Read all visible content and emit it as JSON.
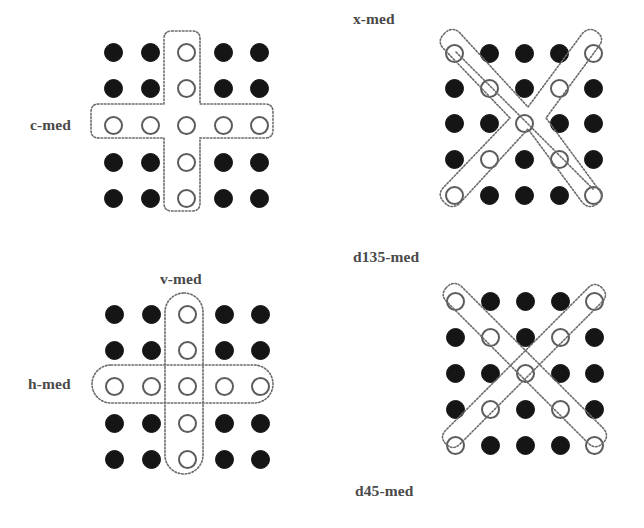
{
  "figure": {
    "background_color": "#ffffff",
    "dot_filled_color": "#151515",
    "dot_hollow_fill": "#ffffff",
    "dot_hollow_stroke": "#5c5c5c",
    "outline_color": "#6b6b6b",
    "label_color": "#4a4a4a",
    "grid_rows": 5,
    "grid_cols": 5
  },
  "panels": [
    {
      "id": "c-med",
      "label": "c-med",
      "label_position": "left",
      "description": "Cross / plus shaped median neighbourhood: full centre row and full centre column selected.",
      "selected_cells": [
        [
          0,
          2
        ],
        [
          1,
          2
        ],
        [
          2,
          0
        ],
        [
          2,
          1
        ],
        [
          2,
          2
        ],
        [
          2,
          3
        ],
        [
          2,
          4
        ],
        [
          3,
          2
        ],
        [
          4,
          2
        ]
      ],
      "outlines": [
        "cross"
      ]
    },
    {
      "id": "x-med",
      "label": "x-med",
      "label_position": "top",
      "description": "X shaped median neighbourhood: both diagonals selected, drawn as one continuous X outline.",
      "selected_cells": [
        [
          0,
          0
        ],
        [
          0,
          4
        ],
        [
          1,
          1
        ],
        [
          1,
          3
        ],
        [
          2,
          2
        ],
        [
          3,
          1
        ],
        [
          3,
          3
        ],
        [
          4,
          0
        ],
        [
          4,
          4
        ]
      ],
      "outlines": [
        "x-combined"
      ]
    },
    {
      "id": "hv-med",
      "labels": [
        "v-med",
        "h-med"
      ],
      "v_label": "v-med",
      "h_label": "h-med",
      "v_label_position": "top",
      "h_label_position": "left",
      "description": "Separate horizontal (h-med) and vertical (v-med) median neighbourhoods overlapping at the centre.",
      "selected_cells": [
        [
          0,
          2
        ],
        [
          1,
          2
        ],
        [
          2,
          0
        ],
        [
          2,
          1
        ],
        [
          2,
          2
        ],
        [
          2,
          3
        ],
        [
          2,
          4
        ],
        [
          3,
          2
        ],
        [
          4,
          2
        ]
      ],
      "outlines": [
        "vertical-bar",
        "horizontal-bar"
      ]
    },
    {
      "id": "d-med",
      "labels": [
        "d135-med",
        "d45-med"
      ],
      "d135_label": "d135-med",
      "d45_label": "d45-med",
      "d135_label_position": "top",
      "d45_label_position": "bottom",
      "description": "Separate 135-degree and 45-degree diagonal median neighbourhoods crossing at the centre.",
      "selected_cells": [
        [
          0,
          0
        ],
        [
          0,
          4
        ],
        [
          1,
          1
        ],
        [
          1,
          3
        ],
        [
          2,
          2
        ],
        [
          3,
          1
        ],
        [
          3,
          3
        ],
        [
          4,
          0
        ],
        [
          4,
          4
        ]
      ],
      "outlines": [
        "diag-135",
        "diag-45"
      ]
    }
  ]
}
